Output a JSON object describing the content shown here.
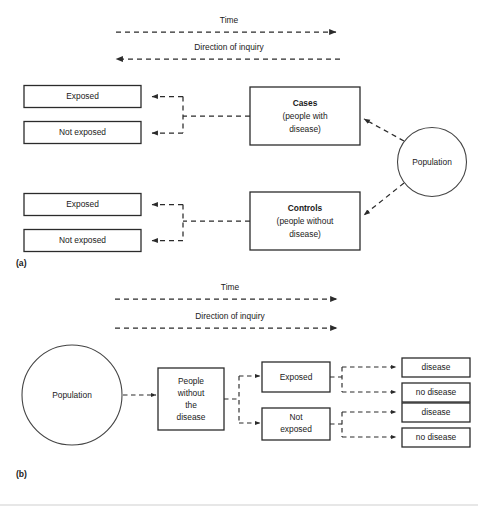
{
  "figure": {
    "width": 478,
    "height": 508,
    "background_color": "#ffffff",
    "line_color": "#2b2b2b"
  },
  "panel_a": {
    "label": "(a)",
    "time_axis": {
      "label": "Time",
      "direction": "right"
    },
    "inquiry_axis": {
      "label": "Direction of inquiry",
      "direction": "left"
    },
    "exposure_boxes": [
      {
        "label": "Exposed"
      },
      {
        "label": "Not exposed"
      },
      {
        "label": "Exposed"
      },
      {
        "label": "Not exposed"
      }
    ],
    "group_boxes": [
      {
        "title": "Cases",
        "line2": "(people with",
        "line3": "disease)"
      },
      {
        "title": "Controls",
        "line2": "(people without",
        "line3": "disease)"
      }
    ],
    "source_circle": {
      "label": "Population"
    }
  },
  "panel_b": {
    "label": "(b)",
    "time_axis": {
      "label": "Time",
      "direction": "right"
    },
    "inquiry_axis": {
      "label": "Direction of inquiry",
      "direction": "right"
    },
    "source_circle": {
      "label": "Population"
    },
    "cohort_box": {
      "line1": "People",
      "line2": "without",
      "line3": "the",
      "line4": "disease"
    },
    "exposure_boxes": [
      {
        "label": "Exposed"
      },
      {
        "line1": "Not",
        "line2": "exposed"
      }
    ],
    "outcome_boxes": [
      {
        "label": "disease"
      },
      {
        "label": "no disease"
      },
      {
        "label": "disease"
      },
      {
        "label": "no disease"
      }
    ]
  }
}
